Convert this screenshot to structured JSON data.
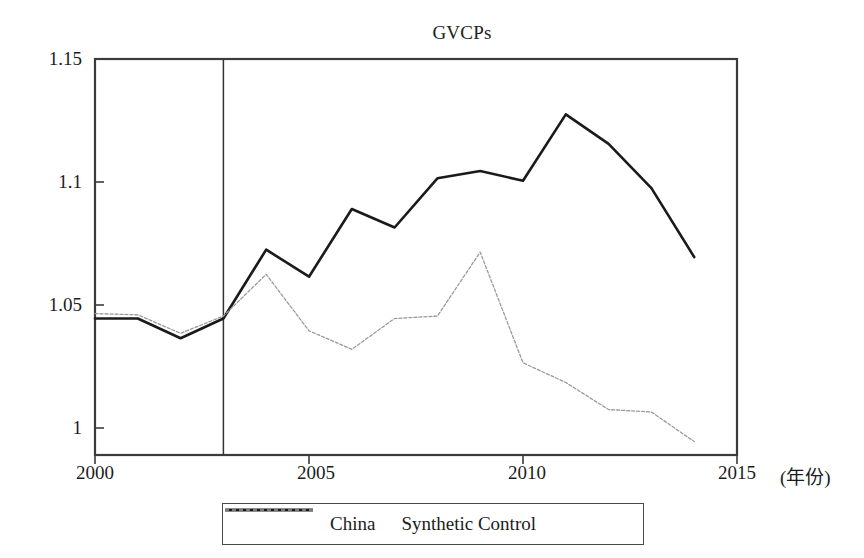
{
  "figure": {
    "title": "GVCPs",
    "width": 864,
    "height": 558
  },
  "axes": {
    "x_unit_label": "(年份)",
    "x_ticks": [
      "2000",
      "2005",
      "2010",
      "2015"
    ],
    "y_ticks": [
      "1.15",
      "1.1",
      "1.05",
      "1"
    ]
  },
  "legend": {
    "entries": [
      {
        "label": "China",
        "style": "solid",
        "color": "#1a1a1a"
      },
      {
        "label": "Synthetic Control",
        "style": "dashed",
        "color": "#9a9a9a"
      }
    ]
  },
  "annotations": {
    "treatment_year": 2003,
    "treatment_line_label": "2003 treatment vertical line"
  },
  "chart_data": {
    "type": "line",
    "title": "GVCPs",
    "xlabel": "(年份)",
    "ylabel": "",
    "xlim": [
      2000,
      2015
    ],
    "ylim": [
      0.99,
      1.15
    ],
    "grid": false,
    "legend_position": "below-plot-center",
    "x": [
      2000,
      2001,
      2002,
      2003,
      2004,
      2005,
      2006,
      2007,
      2008,
      2009,
      2010,
      2011,
      2012,
      2013,
      2014
    ],
    "series": [
      {
        "name": "China",
        "style": "solid",
        "color": "#1a1a1a",
        "values": [
          1.0445,
          1.0445,
          1.0365,
          1.0445,
          1.0725,
          1.0615,
          1.089,
          1.0815,
          1.1015,
          1.1045,
          1.1005,
          1.1275,
          1.1155,
          1.0975,
          1.0695
        ]
      },
      {
        "name": "Synthetic Control",
        "style": "dashed",
        "color": "#9a9a9a",
        "values": [
          1.0465,
          1.046,
          1.0385,
          1.0455,
          1.0625,
          1.0395,
          1.032,
          1.0445,
          1.0455,
          1.0715,
          1.0265,
          1.0185,
          1.0075,
          1.0065,
          0.9945
        ]
      }
    ],
    "vline": {
      "x": 2003,
      "color": "#333333"
    },
    "annotations": []
  }
}
